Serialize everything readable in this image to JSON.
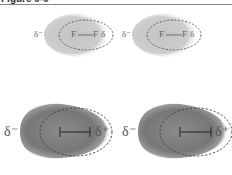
{
  "figure": {
    "title": "Figure 9-9"
  },
  "panels": [
    {
      "id": "top-left",
      "molecule": "F2",
      "atom_left": "F",
      "atom_right": "F",
      "bond": "—",
      "charge_left": "δ⁻",
      "charge_right": "δ",
      "cloud_color": "#c8c8c8"
    },
    {
      "id": "top-right",
      "molecule": "F2",
      "atom_left": "F",
      "atom_right": "F",
      "bond": "—",
      "charge_left": "δ⁻",
      "charge_right": "δ",
      "cloud_color": "#c8c8c8"
    },
    {
      "id": "bottom-left",
      "molecule": "I2",
      "atom_left": "I",
      "atom_right": "I",
      "bond": "—",
      "charge_left": "δ⁻",
      "charge_right": "δ⁺",
      "cloud_color": "#7a7a7a"
    },
    {
      "id": "bottom-right",
      "molecule": "I2",
      "atom_left": "I",
      "atom_right": "I",
      "bond": "—",
      "charge_left": "δ⁻",
      "charge_right": "δ⁺",
      "cloud_color": "#7a7a7a"
    }
  ],
  "colors": {
    "dashed_outline": "#555555",
    "small_cloud": "#c8c8c8",
    "large_cloud": "#7a7a7a"
  }
}
